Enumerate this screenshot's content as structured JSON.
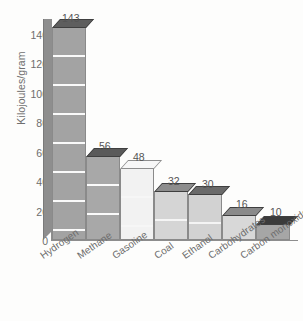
{
  "chart_data": {
    "type": "bar",
    "title": "",
    "xlabel": "",
    "ylabel": "Kilojoules/gram",
    "ylim": [
      0,
      140
    ],
    "yticks": [
      "140",
      "120",
      "100",
      "80",
      "60",
      "40",
      "20",
      "0"
    ],
    "grid": true,
    "legend": "none",
    "categories": [
      "Hydrogen",
      "Methane",
      "Gasoline",
      "Coal",
      "Ethanol",
      "Carbohydrates",
      "Carbon monoxide"
    ],
    "values": [
      143,
      56,
      48,
      32,
      30,
      16,
      10
    ],
    "value_labels": [
      "143",
      "56",
      "48",
      "32",
      "30",
      "16",
      "10"
    ],
    "bar_colors": [
      "#a3a3a3",
      "#a8a8a8",
      "#f2f2f2",
      "#d5d5d5",
      "#d2d2d2",
      "#d8d8d8",
      "#a6a6a6"
    ],
    "top_face_colors": [
      "#5e5e5e",
      "#5a5a5a",
      "#f7f7f7",
      "#8d8d8d",
      "#6a6a6a",
      "#8a8a8a",
      "#3b3b3b"
    ],
    "axis_color": "#8d8d8d",
    "text_color": "#6d6d6d"
  }
}
